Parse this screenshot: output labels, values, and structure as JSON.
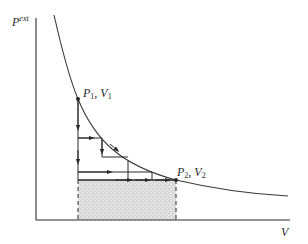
{
  "figure": {
    "y_axis_label": "P",
    "y_axis_label_superscript": "ext",
    "x_axis_label": "V",
    "point1": {
      "p": "P",
      "p_sub": "1",
      "sep": ", ",
      "v": "V",
      "v_sub": "1"
    },
    "point2": {
      "p": "P",
      "p_sub": "2",
      "sep": ", ",
      "v": "V",
      "v_sub": "2"
    },
    "colors": {
      "line": "#2a2a2a",
      "curve": "#3a3a3a",
      "shade": "#d8d8d8"
    }
  }
}
